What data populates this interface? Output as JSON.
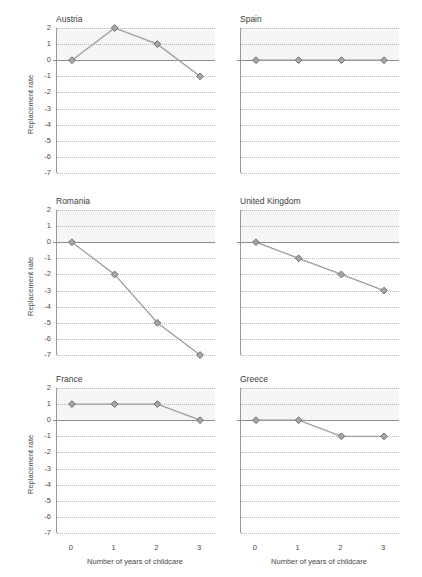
{
  "figure": {
    "title_fragment": "",
    "background": "#ffffff"
  },
  "axes": {
    "ylabel": "Replacement rate",
    "xlabel": "Number of years of childcare",
    "yticks": [
      "2",
      "1",
      "0",
      "-1",
      "-2",
      "-3",
      "-4",
      "-5",
      "-6",
      "-7"
    ],
    "xticks": [
      "0",
      "1",
      "2",
      "3"
    ]
  },
  "style": {
    "marker_fill": "#a6a6a6",
    "marker_stroke": "#6f6f6f",
    "line_color": "#9d9d9d",
    "grid_color": "#b9b9b9",
    "zero_line_color": "#8d8d8d",
    "axis_color": "#9a9a9a",
    "band_color": "#f2f2f2",
    "text_color": "#4a4a4a"
  },
  "chart_data": {
    "type": "line",
    "title": "",
    "xlabel": "Number of years of childcare",
    "ylabel": "Replacement rate",
    "x": [
      0,
      1,
      2,
      3
    ],
    "xlim": [
      -0.35,
      3.35
    ],
    "ylim": [
      -7,
      2
    ],
    "grid": true,
    "legend": "none",
    "panel_layout": {
      "rows": 3,
      "cols": 2
    },
    "panels": [
      {
        "name": "Austria",
        "values": [
          0,
          2,
          1,
          -1
        ]
      },
      {
        "name": "Spain",
        "values": [
          0,
          0,
          0,
          0
        ]
      },
      {
        "name": "Romania",
        "values": [
          0,
          -2,
          -5,
          -7
        ]
      },
      {
        "name": "United Kingdom",
        "values": [
          0,
          -1,
          -2,
          -3
        ]
      },
      {
        "name": "France",
        "values": [
          1,
          1,
          1,
          0
        ]
      },
      {
        "name": "Greece",
        "values": [
          0,
          0,
          -1,
          -1
        ]
      }
    ]
  }
}
